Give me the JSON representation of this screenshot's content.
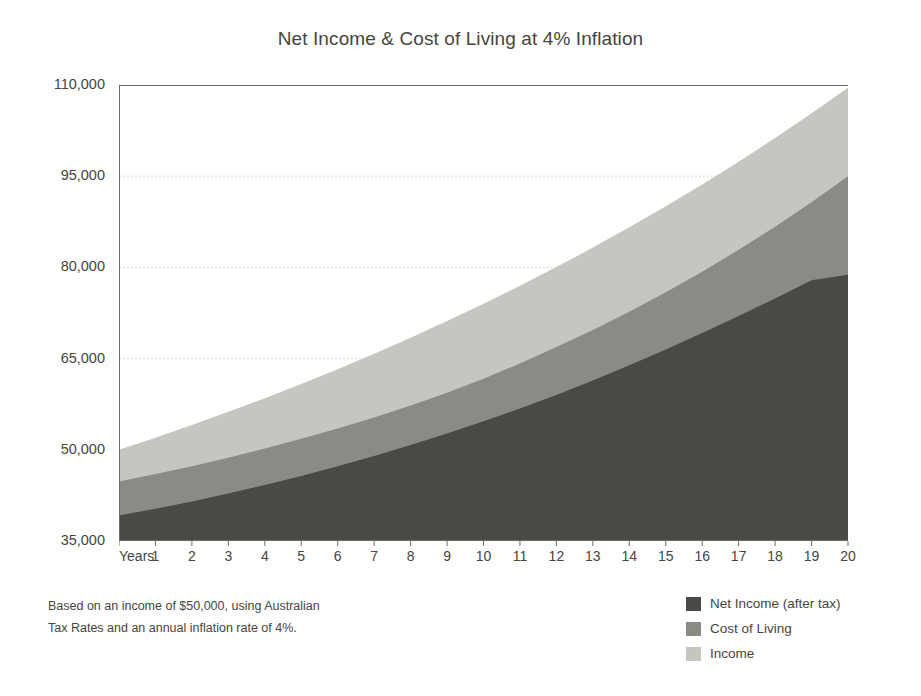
{
  "chart_data": {
    "type": "area",
    "stacked": false,
    "title": "Net Income & Cost of Living at 4% Inflation",
    "xlabel": "Years",
    "ylabel": "",
    "xlim": [
      0,
      20
    ],
    "ylim": [
      35000,
      110000
    ],
    "grid": true,
    "grid_axis": "y",
    "legend_position": "bottom-right",
    "x": [
      0,
      1,
      2,
      3,
      4,
      5,
      6,
      7,
      8,
      9,
      10,
      11,
      12,
      13,
      14,
      15,
      16,
      17,
      18,
      19,
      20
    ],
    "categories": [
      "Years",
      "1",
      "2",
      "3",
      "4",
      "5",
      "6",
      "7",
      "8",
      "9",
      "10",
      "11",
      "12",
      "13",
      "14",
      "15",
      "16",
      "17",
      "18",
      "19",
      "20"
    ],
    "ytick_labels": [
      "110,000",
      "95,000",
      "80,000",
      "65,000",
      "50,000",
      "35,000"
    ],
    "ytick_values": [
      110000,
      95000,
      80000,
      65000,
      50000,
      35000
    ],
    "series": [
      {
        "name": "Income",
        "color": "#c6c5c0",
        "values": [
          50000,
          52000,
          54080,
          56243,
          58493,
          60833,
          63267,
          65797,
          68429,
          71166,
          74012,
          76973,
          80052,
          83254,
          86584,
          90047,
          93649,
          97395,
          101291,
          105343,
          109556
        ]
      },
      {
        "name": "Cost of Living",
        "color": "#8b8a85",
        "values": [
          44800,
          46000,
          47300,
          48700,
          50200,
          51800,
          53500,
          55300,
          57300,
          59400,
          61700,
          64200,
          66900,
          69700,
          72700,
          75900,
          79300,
          82900,
          86700,
          90700,
          95000
        ]
      },
      {
        "name": "Net Income (after tax)",
        "color": "#4b4946",
        "values": [
          39200,
          40300,
          41500,
          42800,
          44200,
          45700,
          47300,
          49000,
          50800,
          52700,
          54700,
          56800,
          59000,
          61400,
          63900,
          66500,
          69200,
          72000,
          74900,
          77900,
          78800
        ]
      }
    ],
    "annotations": [
      "Based on an income of $50,000, using Australian",
      "Tax Rates and an annual inflation rate of 4%."
    ]
  },
  "footnote": {
    "line1": "Based on an income of $50,000, using Australian",
    "line2": "Tax Rates and an annual inflation rate of 4%."
  },
  "legend": {
    "items": [
      {
        "label": "Net Income (after tax)",
        "color": "#4b4946"
      },
      {
        "label": "Cost of Living",
        "color": "#8b8a85"
      },
      {
        "label": "Income",
        "color": "#c6c5c0"
      }
    ]
  },
  "colors": {
    "net_income": "#4b4946",
    "cost_of_living": "#8b8a85",
    "income": "#c6c5c0",
    "axis": "#6b6a66",
    "grid": "#c9c8c4",
    "text": "#46453f",
    "background": "#ffffff"
  }
}
